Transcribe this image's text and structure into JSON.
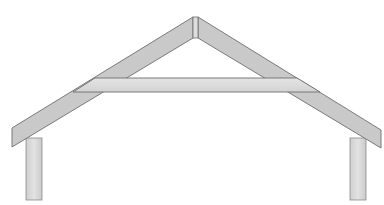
{
  "diagram": {
    "components": [
      {
        "id": "left-rafter",
        "label": "Left rafter"
      },
      {
        "id": "right-rafter",
        "label": "Right rafter"
      },
      {
        "id": "ridge",
        "label": "Ridge"
      },
      {
        "id": "collar-tie",
        "label": "Collar tie"
      },
      {
        "id": "left-post",
        "label": "Left wall post"
      },
      {
        "id": "right-post",
        "label": "Right wall post"
      }
    ],
    "colors": {
      "background": "#ffffff",
      "rafter_fill": "#c8c8c8",
      "collar_fill": "#d9d9d9",
      "post_fill": "#d6d6d6",
      "outline": "#6e6e6e"
    }
  }
}
